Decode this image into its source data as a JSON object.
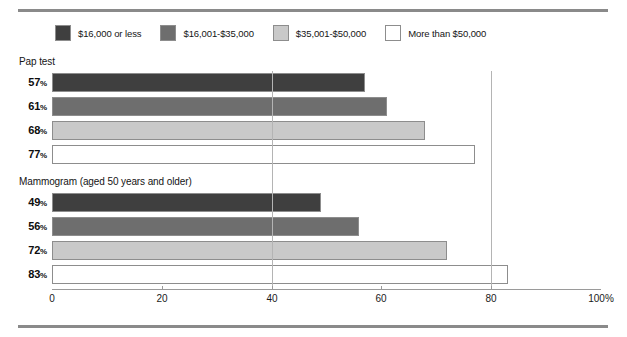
{
  "chart_data": {
    "type": "bar",
    "orientation": "horizontal",
    "title": "",
    "xlabel": "",
    "ylabel": "",
    "xlim": [
      0,
      100
    ],
    "xticks": [
      {
        "value": 0,
        "label": "0"
      },
      {
        "value": 20,
        "label": "20"
      },
      {
        "value": 40,
        "label": "40"
      },
      {
        "value": 60,
        "label": "60"
      },
      {
        "value": 80,
        "label": "80"
      },
      {
        "value": 100,
        "label": "100%"
      }
    ],
    "gridlines": [
      40,
      80
    ],
    "grid": true,
    "legend_position": "top-left",
    "legend": [
      {
        "name": "$16,000 or less",
        "color": "#3f3f3f"
      },
      {
        "name": "$16,001-$35,000",
        "color": "#6e6e6e"
      },
      {
        "name": "$35,001-$50,000",
        "color": "#c9c9c9"
      },
      {
        "name": "More than $50,000",
        "color": "#ffffff"
      }
    ],
    "groups": [
      {
        "label": "Pap test",
        "bars": [
          {
            "series": "$16,000 or less",
            "value": 57,
            "display": "57",
            "suffix": "%",
            "color": "#3f3f3f"
          },
          {
            "series": "$16,001-$35,000",
            "value": 61,
            "display": "61",
            "suffix": "%",
            "color": "#6e6e6e"
          },
          {
            "series": "$35,001-$50,000",
            "value": 68,
            "display": "68",
            "suffix": "%",
            "color": "#c9c9c9"
          },
          {
            "series": "More than $50,000",
            "value": 77,
            "display": "77",
            "suffix": "%",
            "color": "#ffffff"
          }
        ]
      },
      {
        "label": "Mammogram (aged 50 years and older)",
        "bars": [
          {
            "series": "$16,000 or less",
            "value": 49,
            "display": "49",
            "suffix": "%",
            "color": "#3f3f3f"
          },
          {
            "series": "$16,001-$35,000",
            "value": 56,
            "display": "56",
            "suffix": "%",
            "color": "#6e6e6e"
          },
          {
            "series": "$35,001-$50,000",
            "value": 72,
            "display": "72",
            "suffix": "%",
            "color": "#c9c9c9"
          },
          {
            "series": "More than $50,000",
            "value": 83,
            "display": "83",
            "suffix": "%",
            "color": "#ffffff"
          }
        ]
      }
    ]
  },
  "style": {
    "bar_border_color": "#8d8d8d",
    "gridline_color": "#b4b4b4",
    "axis_color": "#9a9a9a",
    "rule_color": "#8a8a8a",
    "text_color": "#141414"
  }
}
